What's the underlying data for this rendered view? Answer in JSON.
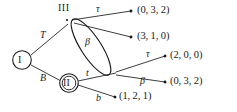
{
  "figure": {
    "background_color": "#ffffff",
    "stroke_color": "#1a1a1a"
  },
  "nodes": [
    {
      "id": "I",
      "label": "I",
      "shape": "single-circle",
      "x": 22,
      "y": 60
    },
    {
      "id": "II",
      "label": "II",
      "shape": "double-circle",
      "x": 69,
      "y": 83
    },
    {
      "id": "III",
      "label": "III",
      "shape": "point",
      "x": 67,
      "y": 20
    }
  ],
  "information_set": {
    "label": "ellipse",
    "shape": "ellipse",
    "cx": 91,
    "cy": 47,
    "rx": 33,
    "ry": 10,
    "rotation_deg": 57
  },
  "edges": [
    {
      "id": "e-T",
      "label": "T",
      "from": "I",
      "to": "III"
    },
    {
      "id": "e-B",
      "label": "B",
      "from": "I",
      "to": "II"
    },
    {
      "id": "e-tau-1",
      "label": "τ",
      "from": "III",
      "to": "p1"
    },
    {
      "id": "e-beta-1",
      "label": "β",
      "from": "III",
      "to": "p2"
    },
    {
      "id": "e-t",
      "label": "t",
      "from": "II",
      "to": "set-bottom"
    },
    {
      "id": "e-b",
      "label": "b",
      "from": "II",
      "to": "p5"
    },
    {
      "id": "e-tau-2",
      "label": "τ",
      "from": "set-bottom",
      "to": "p3"
    },
    {
      "id": "e-beta-2",
      "label": "β",
      "from": "set-bottom",
      "to": "p4"
    }
  ],
  "payoffs": [
    {
      "id": "p1",
      "text": "(0, 3, 2)",
      "x": 137,
      "y": 7
    },
    {
      "id": "p2",
      "text": "(3, 1, 0)",
      "x": 137,
      "y": 33
    },
    {
      "id": "p3",
      "text": "(2, 0, 0)",
      "x": 170,
      "y": 52
    },
    {
      "id": "p4",
      "text": "(0, 3, 2)",
      "x": 170,
      "y": 77
    },
    {
      "id": "p5",
      "text": "(1, 2, 1)",
      "x": 119,
      "y": 92
    }
  ],
  "labels": {
    "node_I": "I",
    "node_II": "II",
    "node_III": "III",
    "edge_T": "T",
    "edge_B": "B",
    "edge_t": "t",
    "edge_b": "b",
    "edge_tau_top": "τ",
    "edge_tau_mid": "τ",
    "edge_beta_upper": "β",
    "edge_beta_lower": "β"
  }
}
